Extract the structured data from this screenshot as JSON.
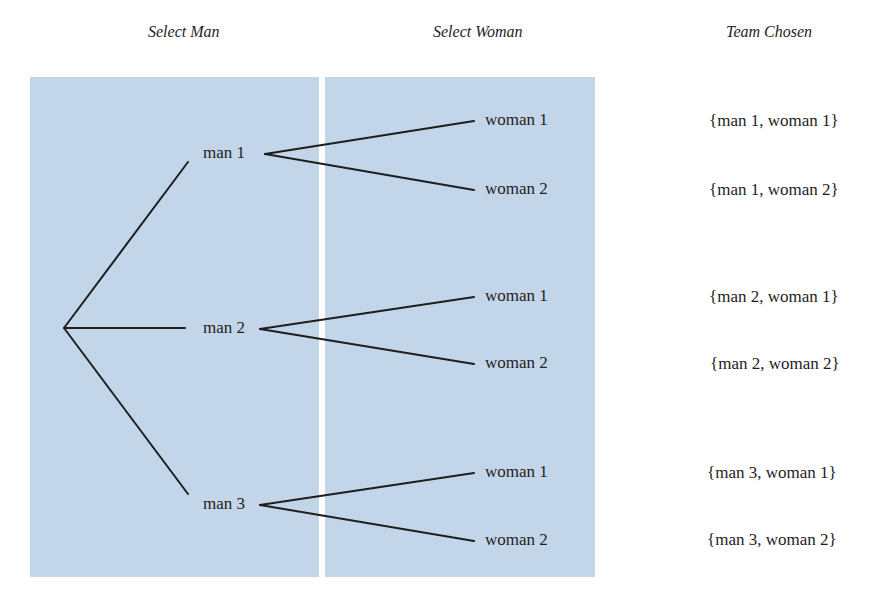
{
  "headers": {
    "select_man": "Select Man",
    "select_woman": "Select Woman",
    "team_chosen": "Team Chosen"
  },
  "colors": {
    "panel_fill": "#c3d5e8",
    "line": "#1e1e1e",
    "background": "#ffffff"
  },
  "tree": {
    "root": "",
    "men": [
      {
        "label": "man 1",
        "women": [
          "woman 1",
          "woman 2"
        ]
      },
      {
        "label": "man 2",
        "women": [
          "woman 1",
          "woman 2"
        ]
      },
      {
        "label": "man 3",
        "women": [
          "woman 1",
          "woman 2"
        ]
      }
    ]
  },
  "outcomes": [
    "{man 1, woman 1}",
    "{man 1, woman 2}",
    "{man 2, woman 1}",
    "{man 2, woman 2}",
    "{man 3, woman 1}",
    "{man 3, woman 2}"
  ]
}
